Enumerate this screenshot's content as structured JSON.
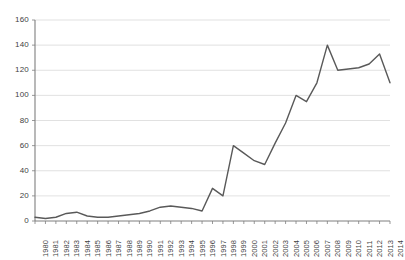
{
  "chart_data": {
    "type": "line",
    "title": "",
    "subtitle": "",
    "xlabel": "",
    "ylabel": "",
    "grid": true,
    "legend": false,
    "legend_position": "none",
    "line_color": "#595959",
    "grid_color": "#d9d9d9",
    "axis_color": "#7f7f7f",
    "text_color": "#3f3f3f",
    "background": "#ffffff",
    "ylim": [
      0,
      160
    ],
    "yticks": [
      160,
      140,
      120,
      100,
      80,
      60,
      40,
      20,
      0
    ],
    "ytick_labels": [
      "160",
      "140",
      "120",
      "100",
      "80",
      "60",
      "40",
      "20",
      "0"
    ],
    "categories": [
      "1980",
      "1981",
      "1982",
      "1983",
      "1984",
      "1985",
      "1986",
      "1987",
      "1988",
      "1989",
      "1990",
      "1991",
      "1992",
      "1993",
      "1994",
      "1995",
      "1996",
      "1997",
      "1998",
      "1999",
      "2000",
      "2001",
      "2002",
      "2003",
      "2004",
      "2005",
      "2006",
      "2007",
      "2008",
      "2009",
      "2010",
      "2011",
      "2012",
      "2013",
      "2014"
    ],
    "values": [
      3,
      2,
      3,
      6,
      7,
      4,
      3,
      3,
      4,
      5,
      6,
      8,
      11,
      12,
      11,
      10,
      8,
      26,
      20,
      60,
      54,
      48,
      45,
      62,
      78,
      100,
      95,
      110,
      140,
      120,
      121,
      122,
      125,
      133,
      110
    ],
    "series": [
      {
        "name": "series-1",
        "values": [
          3,
          2,
          3,
          6,
          7,
          4,
          3,
          3,
          4,
          5,
          6,
          8,
          11,
          12,
          11,
          10,
          8,
          26,
          20,
          60,
          54,
          48,
          45,
          62,
          78,
          100,
          95,
          110,
          140,
          120,
          121,
          122,
          125,
          133,
          110
        ]
      }
    ]
  }
}
